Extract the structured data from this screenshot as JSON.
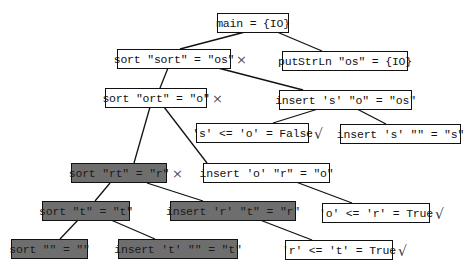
{
  "diagram": {
    "fill_colors": {
      "normal": "#ffffff",
      "shaded": "#6e6e6e",
      "border": "#111111"
    },
    "nodes": [
      {
        "id": "n_main",
        "label": "main = {IO}",
        "shaded": false,
        "mark": ""
      },
      {
        "id": "n_sort_sort",
        "label": "sort \"sort\" = \"os\"",
        "shaded": false,
        "mark": "×"
      },
      {
        "id": "n_putstrln",
        "label": "putStrLn \"os\" = {IO}",
        "shaded": false,
        "mark": ""
      },
      {
        "id": "n_sort_ort",
        "label": "sort \"ort\" = \"o\"",
        "shaded": false,
        "mark": "×"
      },
      {
        "id": "n_insert_s_o",
        "label": "insert 's' \"o\" = \"os\"",
        "shaded": false,
        "mark": ""
      },
      {
        "id": "n_cmp_s_o",
        "label": "'s' <= 'o' = False",
        "shaded": false,
        "mark": "√"
      },
      {
        "id": "n_insert_s_empty",
        "label": "insert 's' \"\" = \"s\"",
        "shaded": false,
        "mark": ""
      },
      {
        "id": "n_sort_rt",
        "label": "sort \"rt\" = \"r\"",
        "shaded": true,
        "mark": "×"
      },
      {
        "id": "n_insert_o_r",
        "label": "insert 'o' \"r\" = \"o\"",
        "shaded": false,
        "mark": ""
      },
      {
        "id": "n_sort_t",
        "label": "sort \"t\" = \"t\"",
        "shaded": true,
        "mark": ""
      },
      {
        "id": "n_insert_r_t",
        "label": "insert 'r' \"t\" = \"r\"",
        "shaded": true,
        "mark": ""
      },
      {
        "id": "n_cmp_o_r",
        "label": "'o' <= 'r' = True",
        "shaded": false,
        "mark": "√"
      },
      {
        "id": "n_sort_empty",
        "label": "sort \"\" = \"\"",
        "shaded": true,
        "mark": ""
      },
      {
        "id": "n_insert_t_empty",
        "label": "insert 't' \"\" = \"t\"",
        "shaded": true,
        "mark": ""
      },
      {
        "id": "n_cmp_r_t",
        "label": "'r' <= 't' = True",
        "shaded": false,
        "mark": "√"
      }
    ],
    "edges": [
      [
        "n_main",
        "n_sort_sort"
      ],
      [
        "n_main",
        "n_putstrln"
      ],
      [
        "n_sort_sort",
        "n_sort_ort"
      ],
      [
        "n_sort_sort",
        "n_insert_s_o"
      ],
      [
        "n_insert_s_o",
        "n_cmp_s_o"
      ],
      [
        "n_insert_s_o",
        "n_insert_s_empty"
      ],
      [
        "n_sort_ort",
        "n_sort_rt"
      ],
      [
        "n_sort_ort",
        "n_insert_o_r"
      ],
      [
        "n_insert_o_r",
        "n_cmp_o_r"
      ],
      [
        "n_sort_rt",
        "n_sort_t"
      ],
      [
        "n_sort_rt",
        "n_insert_r_t"
      ],
      [
        "n_sort_t",
        "n_sort_empty"
      ],
      [
        "n_sort_t",
        "n_insert_t_empty"
      ],
      [
        "n_insert_r_t",
        "n_cmp_r_t"
      ]
    ]
  }
}
